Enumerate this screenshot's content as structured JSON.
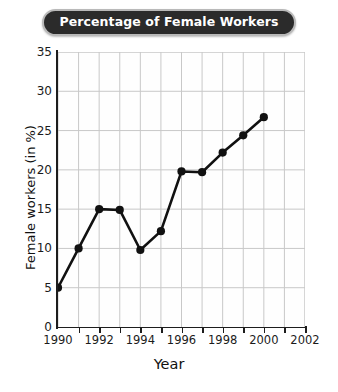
{
  "chart_data": {
    "type": "line",
    "title": "Percentage of Female Workers",
    "xlabel": "Year",
    "ylabel": "Female workers (in %)",
    "x": [
      1990,
      1991,
      1992,
      1993,
      1994,
      1995,
      1996,
      1997,
      1998,
      1999,
      2000
    ],
    "values": [
      5.0,
      10.0,
      15.0,
      14.9,
      9.8,
      12.2,
      19.8,
      19.7,
      22.2,
      24.4,
      26.7
    ],
    "series": [
      {
        "name": "Female workers (in %)",
        "values": [
          5.0,
          10.0,
          15.0,
          14.9,
          9.8,
          12.2,
          19.8,
          19.7,
          22.2,
          24.4,
          26.7
        ]
      }
    ],
    "xlim": [
      1990,
      2002
    ],
    "ylim": [
      0,
      35
    ],
    "xticks": [
      1990,
      1992,
      1994,
      1996,
      1998,
      2000,
      2002
    ],
    "xtick_labels": [
      "1990",
      "1992",
      "1994",
      "1996",
      "1998",
      "2000",
      "2002"
    ],
    "x_minor_ticks": [
      1991,
      1993,
      1995,
      1997,
      1999,
      2001
    ],
    "yticks": [
      0,
      5,
      10,
      15,
      20,
      25,
      30,
      35
    ],
    "ytick_labels": [
      "0",
      "5",
      "10",
      "15",
      "20",
      "25",
      "30",
      "35"
    ],
    "grid": true,
    "legend": null,
    "marker": "filled-circle",
    "line_color": "#111111",
    "marker_color": "#111111",
    "grid_color": "#c8c8c8",
    "axis_color": "#1d1d1d",
    "title_background": "#2b2b2b",
    "title_text_color": "#ffffff",
    "title_border_color": "#b9b9b9"
  }
}
